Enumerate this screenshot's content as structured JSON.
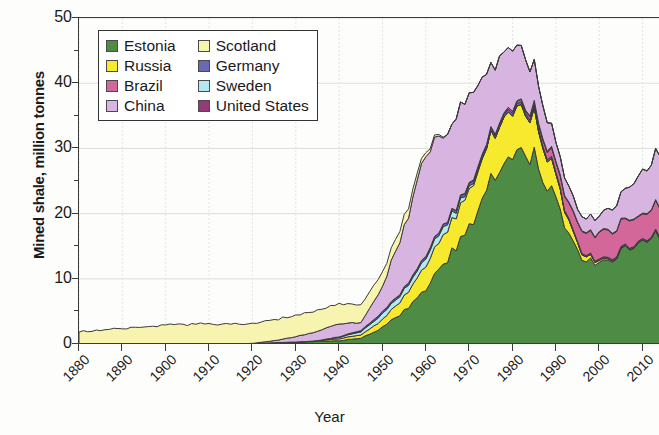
{
  "chart_data": {
    "type": "area",
    "stacked": true,
    "title": "",
    "xlabel": "Year",
    "ylabel": "Mined shale, million tonnes",
    "xlim": [
      1880,
      2014
    ],
    "ylim": [
      0,
      50
    ],
    "ytick_labels": [
      "0",
      "10",
      "20",
      "30",
      "40",
      "50"
    ],
    "ytick_values": [
      0,
      10,
      20,
      30,
      40,
      50
    ],
    "yminor_step": 5,
    "xtick_labels": [
      "1880",
      "1890",
      "1900",
      "1910",
      "1920",
      "1930",
      "1940",
      "1950",
      "1960",
      "1970",
      "1980",
      "1990",
      "2000",
      "2010"
    ],
    "xtick_values": [
      1880,
      1890,
      1900,
      1910,
      1920,
      1930,
      1940,
      1950,
      1960,
      1970,
      1980,
      1990,
      2000,
      2010
    ],
    "grid": true,
    "legend_position": "upper-left-inside",
    "legend_columns": 2,
    "stack_order": [
      "Estonia",
      "Russia",
      "Sweden",
      "Germany",
      "Brazil",
      "United States",
      "China",
      "Scotland"
    ],
    "colors": {
      "Estonia": "#4e8b45",
      "Russia": "#f7ea2e",
      "Brazil": "#d4679a",
      "China": "#d8b5e0",
      "Scotland": "#f7f4b0",
      "Germany": "#6a6ab4",
      "Sweden": "#b4e8f0",
      "United States": "#943a78"
    },
    "x": [
      1880,
      1885,
      1890,
      1895,
      1900,
      1905,
      1910,
      1915,
      1920,
      1925,
      1930,
      1935,
      1940,
      1945,
      1950,
      1955,
      1960,
      1965,
      1970,
      1975,
      1980,
      1985,
      1990,
      1995,
      2000,
      2005,
      2010,
      2014
    ],
    "series": [
      {
        "name": "Estonia",
        "values": [
          0,
          0,
          0,
          0,
          0,
          0,
          0,
          0,
          0.1,
          0.2,
          0.3,
          0.4,
          0.5,
          0.9,
          2.5,
          5.0,
          8.5,
          13.0,
          18.0,
          25.0,
          30.0,
          29.0,
          22.0,
          14.0,
          12.0,
          14.0,
          16.0,
          17.0
        ]
      },
      {
        "name": "Russia",
        "values": [
          0,
          0,
          0,
          0,
          0,
          0,
          0,
          0,
          0,
          0,
          0,
          0.1,
          0.3,
          0.5,
          1.2,
          2.2,
          3.5,
          4.5,
          5.5,
          6.5,
          7.0,
          6.0,
          3.5,
          1.0,
          0.3,
          0.1,
          0.0,
          0.0
        ]
      },
      {
        "name": "Sweden",
        "values": [
          0,
          0,
          0,
          0,
          0,
          0,
          0,
          0,
          0,
          0,
          0,
          0,
          0.2,
          0.5,
          0.9,
          1.0,
          1.2,
          1.2,
          0.4,
          0.0,
          0.0,
          0.0,
          0.0,
          0.0,
          0.0,
          0.0,
          0.0,
          0.0
        ]
      },
      {
        "name": "Germany",
        "values": [
          0,
          0,
          0,
          0,
          0,
          0,
          0,
          0,
          0,
          0,
          0,
          0,
          0.1,
          0.2,
          0.3,
          0.3,
          0.4,
          0.4,
          0.4,
          0.4,
          0.4,
          0.4,
          0.3,
          0.2,
          0.2,
          0.2,
          0.2,
          0.2
        ]
      },
      {
        "name": "Brazil",
        "values": [
          0,
          0,
          0,
          0,
          0,
          0,
          0,
          0,
          0,
          0,
          0,
          0,
          0,
          0,
          0,
          0,
          0,
          0,
          0.1,
          0.2,
          0.3,
          0.5,
          1.5,
          3.0,
          4.0,
          4.0,
          4.0,
          4.5
        ]
      },
      {
        "name": "United States",
        "values": [
          0,
          0,
          0,
          0,
          0,
          0,
          0,
          0,
          0,
          0,
          0,
          0,
          0,
          0,
          0,
          0,
          0,
          0,
          0,
          0,
          0,
          0.2,
          0.2,
          0.1,
          0.1,
          0.1,
          0.1,
          0.1
        ]
      },
      {
        "name": "China",
        "values": [
          0,
          0,
          0,
          0,
          0,
          0,
          0,
          0,
          0,
          0.3,
          0.8,
          1.5,
          2.0,
          1.2,
          4.0,
          9.0,
          16.0,
          13.0,
          14.0,
          10.0,
          9.5,
          6.0,
          3.0,
          2.0,
          2.5,
          4.0,
          6.5,
          8.0
        ]
      },
      {
        "name": "Scotland",
        "values": [
          1.9,
          2.1,
          2.4,
          2.6,
          2.9,
          3.0,
          3.1,
          3.0,
          3.1,
          3.2,
          3.3,
          3.2,
          3.1,
          2.6,
          2.2,
          1.6,
          0.6,
          0.0,
          0.0,
          0.0,
          0.0,
          0.0,
          0.0,
          0.0,
          0.0,
          0.0,
          0.0,
          0.0
        ]
      }
    ],
    "annotations": {
      "peak_total": 47,
      "peak_year": 1981
    }
  },
  "legend": {
    "items": [
      {
        "label": "Estonia",
        "color": "#4e8b45"
      },
      {
        "label": "Scotland",
        "color": "#f7f4b0"
      },
      {
        "label": "Russia",
        "color": "#f7ea2e"
      },
      {
        "label": "Germany",
        "color": "#6a6ab4"
      },
      {
        "label": "Brazil",
        "color": "#d4679a"
      },
      {
        "label": "Sweden",
        "color": "#b4e8f0"
      },
      {
        "label": "China",
        "color": "#d8b5e0"
      },
      {
        "label": "United States",
        "color": "#943a78"
      }
    ]
  }
}
